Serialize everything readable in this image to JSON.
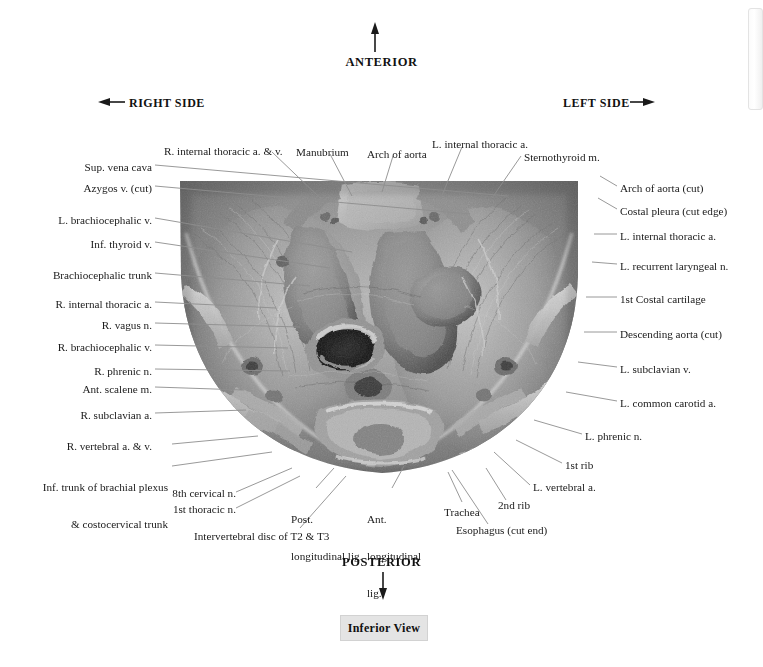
{
  "orientation": {
    "anterior": "ANTERIOR",
    "posterior": "POSTERIOR",
    "right_side": "RIGHT SIDE",
    "left_side": "LEFT SIDE"
  },
  "caption": {
    "text": "Inferior View"
  },
  "labels_top": [
    {
      "text": "R. internal thoracic a. & v.",
      "x": 164,
      "y": 145,
      "align": "left"
    },
    {
      "text": "Manubrium",
      "x": 296,
      "y": 146,
      "align": "left"
    },
    {
      "text": "Arch of aorta",
      "x": 367,
      "y": 148,
      "align": "left"
    },
    {
      "text": "L. internal thoracic a.",
      "x": 432,
      "y": 138,
      "align": "left"
    },
    {
      "text": "Sternothyroid m.",
      "x": 524,
      "y": 151,
      "align": "left"
    }
  ],
  "labels_left": [
    {
      "text": "Sup. vena cava",
      "x": 152,
      "y": 161,
      "align": "right"
    },
    {
      "text": "Azygos v. (cut)",
      "x": 152,
      "y": 182,
      "align": "right"
    },
    {
      "text": "L. brachiocephalic v.",
      "x": 152,
      "y": 214,
      "align": "right"
    },
    {
      "text": "Inf. thyroid v.",
      "x": 152,
      "y": 238,
      "align": "right"
    },
    {
      "text": "Brachiocephalic trunk",
      "x": 152,
      "y": 269,
      "align": "right"
    },
    {
      "text": "R. internal thoracic a.",
      "x": 152,
      "y": 298,
      "align": "right"
    },
    {
      "text": "R. vagus n.",
      "x": 152,
      "y": 319,
      "align": "right"
    },
    {
      "text": "R. brachiocephalic v.",
      "x": 152,
      "y": 341,
      "align": "right"
    },
    {
      "text": "R. phrenic n.",
      "x": 152,
      "y": 365,
      "align": "right"
    },
    {
      "text": "Ant. scalene m.",
      "x": 152,
      "y": 383,
      "align": "right"
    },
    {
      "text": "R. subclavian a.",
      "x": 152,
      "y": 409,
      "align": "right"
    },
    {
      "text": "R. vertebral a. & v.",
      "x": 152,
      "y": 440,
      "align": "right"
    }
  ],
  "labels_left_multiline": [
    {
      "line1": "Inf. trunk of brachial plexus",
      "line2": "& costocervical trunk",
      "x": 166,
      "y": 456,
      "align": "right"
    }
  ],
  "labels_right": [
    {
      "text": "Arch of aorta (cut)",
      "x": 620,
      "y": 189,
      "align": "left"
    },
    {
      "text": "Costal pleura (cut edge)",
      "x": 620,
      "y": 212,
      "align": "left"
    },
    {
      "text": "L. internal thoracic a.",
      "x": 620,
      "y": 237,
      "align": "left"
    },
    {
      "text": "L. recurrent laryngeal n.",
      "x": 620,
      "y": 267,
      "align": "left"
    },
    {
      "text": "1st Costal cartilage",
      "x": 620,
      "y": 300,
      "align": "left"
    },
    {
      "text": "Descending aorta (cut)",
      "x": 620,
      "y": 335,
      "align": "left"
    },
    {
      "text": "L. subclavian v.",
      "x": 620,
      "y": 370,
      "align": "left"
    },
    {
      "text": "L. common carotid a.",
      "x": 620,
      "y": 404,
      "align": "left"
    },
    {
      "text": "L. phrenic n.",
      "x": 585,
      "y": 437,
      "align": "left"
    },
    {
      "text": "1st rib",
      "x": 565,
      "y": 466,
      "align": "left"
    },
    {
      "text": "L. vertebral a.",
      "x": 533,
      "y": 488,
      "align": "left"
    }
  ],
  "labels_bottom": [
    {
      "text": "8th cervical n.",
      "x": 232,
      "y": 494,
      "align": "right"
    },
    {
      "text": "1st thoracic n.",
      "x": 232,
      "y": 510,
      "align": "right"
    },
    {
      "text": "Intervertebral disc of T2 & T3",
      "x": 194,
      "y": 536,
      "align": "left"
    },
    {
      "text": "Trachea",
      "x": 444,
      "y": 512,
      "align": "left"
    },
    {
      "text": "2nd rib",
      "x": 498,
      "y": 506,
      "align": "left"
    },
    {
      "text": "Esophagus (cut end)",
      "x": 456,
      "y": 530,
      "align": "left"
    }
  ],
  "labels_bottom_multiline": [
    {
      "line1": "Post.",
      "line2": "longitudinal lig.",
      "line3": "",
      "x": 291,
      "y": 494,
      "align": "left"
    },
    {
      "line1": "Ant.",
      "line2": "longitudinal",
      "line3": "lig.",
      "x": 367,
      "y": 494,
      "align": "left"
    }
  ],
  "colors": {
    "text": "#1a1a1a",
    "leader": "#8a8a8a",
    "caption_bg": "#e4e4e4",
    "page_bg": "#ffffff"
  },
  "scrollbar": {
    "name": "vertical-scrollbar"
  }
}
